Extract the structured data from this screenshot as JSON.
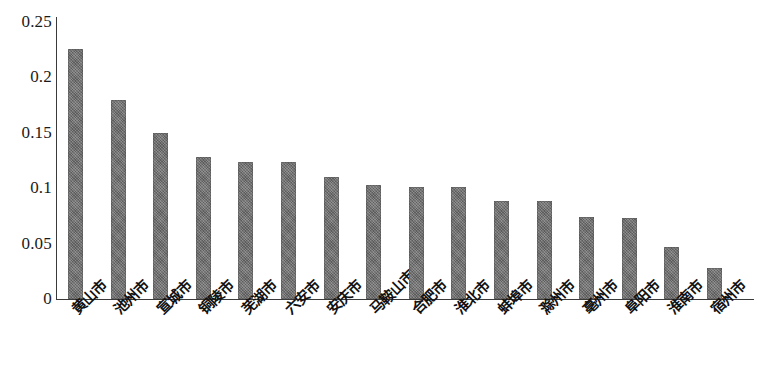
{
  "chart_data": {
    "type": "bar",
    "title": "",
    "subtitle": "",
    "xlabel": "",
    "ylabel": "",
    "ylim": [
      0,
      0.25
    ],
    "yticks": [
      "0",
      "0.05",
      "0.1",
      "0.15",
      "0.2",
      "0.25"
    ],
    "ytick_values": [
      0,
      0.05,
      0.1,
      0.15,
      0.2,
      0.25
    ],
    "grid": false,
    "legend": null,
    "legend_position": "none",
    "orientation": "vertical",
    "bar_color": "#6e6e6e",
    "axis_color": "#3a3a3a",
    "categories": [
      "黄山市",
      "池州市",
      "宣城市",
      "铜陵市",
      "芜湖市",
      "六安市",
      "安庆市",
      "马鞍山市",
      "合肥市",
      "淮北市",
      "蚌埠市",
      "滁州市",
      "亳州市",
      "阜阳市",
      "淮南市",
      "宿州市"
    ],
    "values": [
      0.226,
      0.18,
      0.15,
      0.128,
      0.124,
      0.124,
      0.11,
      0.103,
      0.101,
      0.101,
      0.088,
      0.088,
      0.074,
      0.073,
      0.047,
      0.028
    ]
  }
}
